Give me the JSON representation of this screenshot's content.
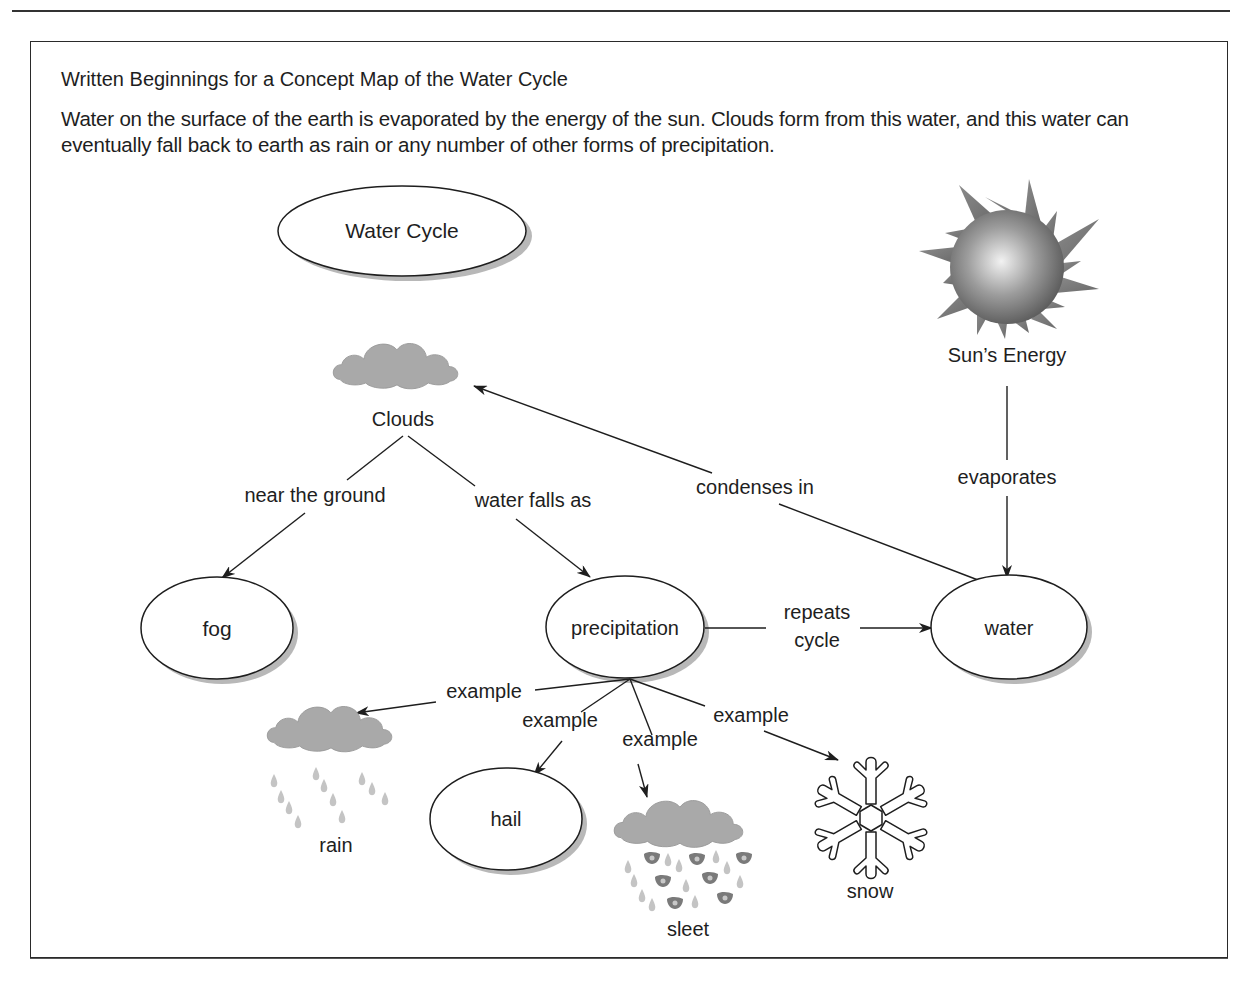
{
  "figure": {
    "title": "Written Beginnings for a Concept Map of the Water Cycle",
    "intro": "Water on the surface of the earth is evaporated by the energy of the sun. Clouds form from this water, and this water can eventually fall back to earth as rain or any number of other forms of precipitation."
  },
  "nodes": {
    "water_cycle": "Water Cycle",
    "sun": "Sun’s Energy",
    "clouds": "Clouds",
    "fog": "fog",
    "precipitation": "precipitation",
    "water": "water",
    "rain": "rain",
    "hail": "hail",
    "sleet": "sleet",
    "snow": "snow"
  },
  "links": {
    "near_ground": "near the ground",
    "water_falls_as": "water falls as",
    "condenses_in": "condenses in",
    "evaporates": "evaporates",
    "repeats_1": "repeats",
    "repeats_2": "cycle",
    "example_rain": "example",
    "example_hail": "example",
    "example_sleet": "example",
    "example_snow": "example"
  },
  "colors": {
    "line": "#1e1e1e",
    "shadow": "#9a9a9a",
    "cloud": "#a9a9a9",
    "drop": "#c4c4c4"
  }
}
